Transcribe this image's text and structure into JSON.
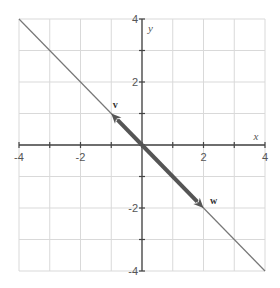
{
  "chart_data": {
    "type": "line",
    "title": "",
    "xlabel": "x",
    "ylabel": "y",
    "xlim": [
      -4,
      4
    ],
    "ylim": [
      -4,
      4
    ],
    "grid": true,
    "x_ticks": [
      -4,
      -3,
      -2,
      -1,
      0,
      1,
      2,
      3,
      4
    ],
    "y_ticks": [
      -4,
      -3,
      -2,
      -1,
      0,
      1,
      2,
      3,
      4
    ],
    "x_tick_labels": [
      {
        "value": -4,
        "label": "-4"
      },
      {
        "value": -2,
        "label": "-2"
      },
      {
        "value": 2,
        "label": "2"
      },
      {
        "value": 4,
        "label": "4"
      }
    ],
    "y_tick_labels": [
      {
        "value": 4,
        "label": "4"
      },
      {
        "value": 2,
        "label": "2"
      },
      {
        "value": -2,
        "label": "-2"
      },
      {
        "value": -4,
        "label": "-4"
      }
    ],
    "series": [
      {
        "name": "line y = -x",
        "kind": "line",
        "points": [
          [
            -4,
            4
          ],
          [
            4,
            -4
          ]
        ],
        "color": "#777777"
      }
    ],
    "vectors": [
      {
        "name": "v",
        "label": "v",
        "from": [
          0,
          0
        ],
        "to": [
          -1,
          1
        ],
        "color": "#555555"
      },
      {
        "name": "w",
        "label": "w",
        "from": [
          0,
          0
        ],
        "to": [
          2,
          -2
        ],
        "color": "#555555"
      }
    ],
    "legend": null
  },
  "colors": {
    "grid": "#d9d9d9",
    "axis": "#444444",
    "line": "#777777",
    "vector": "#555555",
    "text": "#555555"
  }
}
